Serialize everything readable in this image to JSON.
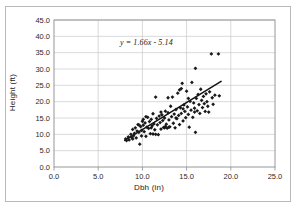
{
  "chart_data": {
    "type": "scatter",
    "title": "",
    "xlabel": "Dbh (in)",
    "ylabel": "Height (ft)",
    "xlim": [
      0.0,
      25.0
    ],
    "ylim": [
      0.0,
      45.0
    ],
    "xticks": [
      "0.0",
      "5.0",
      "10.0",
      "15.0",
      "20.0",
      "25.0"
    ],
    "yticks": [
      "0.0",
      "5.0",
      "10.0",
      "15.0",
      "20.0",
      "25.0",
      "30.0",
      "35.0",
      "40.0",
      "45.0"
    ],
    "xtick_values": [
      0,
      5,
      10,
      15,
      20,
      25
    ],
    "ytick_values": [
      0,
      5,
      10,
      15,
      20,
      25,
      30,
      35,
      40,
      45
    ],
    "grid": "both",
    "legend": "none",
    "marker": "diamond",
    "marker_color": "#1a1a1a",
    "gridline_color": "#c8c8c8",
    "axis_color": "#8c8c8c",
    "plot_background": "#ffffff",
    "annotations": [
      {
        "text": "y = 1.66x - 5.14",
        "x": 10.8,
        "y": 37.2,
        "style": "italic"
      }
    ],
    "trendline": {
      "type": "linear",
      "slope": 1.66,
      "intercept": -5.14,
      "equation": "y = 1.66x - 5.14",
      "x_start": 8.0,
      "x_end": 18.9,
      "color": "#111111"
    },
    "points": [
      [
        8.1,
        8.6
      ],
      [
        8.2,
        8.1
      ],
      [
        8.4,
        9.2
      ],
      [
        8.5,
        8.3
      ],
      [
        8.7,
        10.0
      ],
      [
        8.8,
        9.0
      ],
      [
        8.9,
        11.5
      ],
      [
        9.0,
        9.6
      ],
      [
        9.1,
        10.3
      ],
      [
        9.2,
        12.0
      ],
      [
        9.3,
        8.9
      ],
      [
        9.4,
        11.0
      ],
      [
        9.5,
        13.0
      ],
      [
        9.6,
        10.6
      ],
      [
        9.7,
        7.0
      ],
      [
        9.8,
        12.4
      ],
      [
        9.9,
        11.2
      ],
      [
        10.0,
        14.0
      ],
      [
        10.1,
        12.8
      ],
      [
        10.2,
        10.8
      ],
      [
        10.3,
        13.5
      ],
      [
        10.4,
        9.4
      ],
      [
        10.5,
        12.2
      ],
      [
        10.6,
        15.2
      ],
      [
        10.7,
        11.8
      ],
      [
        10.8,
        13.9
      ],
      [
        10.9,
        10.2
      ],
      [
        11.0,
        14.6
      ],
      [
        11.1,
        12.6
      ],
      [
        11.2,
        16.3
      ],
      [
        11.3,
        13.2
      ],
      [
        11.4,
        11.4
      ],
      [
        11.5,
        21.4
      ],
      [
        11.6,
        14.9
      ],
      [
        11.7,
        12.9
      ],
      [
        11.8,
        9.9
      ],
      [
        11.9,
        15.6
      ],
      [
        12.0,
        13.6
      ],
      [
        12.1,
        11.6
      ],
      [
        12.2,
        16.0
      ],
      [
        12.3,
        14.2
      ],
      [
        12.4,
        12.1
      ],
      [
        12.5,
        15.0
      ],
      [
        12.6,
        17.1
      ],
      [
        12.7,
        13.1
      ],
      [
        12.8,
        11.9
      ],
      [
        12.9,
        16.6
      ],
      [
        13.0,
        14.4
      ],
      [
        13.1,
        12.3
      ],
      [
        13.2,
        18.6
      ],
      [
        13.3,
        15.4
      ],
      [
        13.4,
        21.4
      ],
      [
        13.5,
        13.4
      ],
      [
        13.6,
        16.2
      ],
      [
        13.7,
        12.0
      ],
      [
        13.8,
        17.6
      ],
      [
        13.9,
        14.8
      ],
      [
        14.0,
        22.6
      ],
      [
        14.1,
        15.8
      ],
      [
        14.2,
        13.0
      ],
      [
        14.3,
        18.1
      ],
      [
        14.4,
        16.4
      ],
      [
        14.5,
        25.6
      ],
      [
        14.6,
        14.1
      ],
      [
        14.7,
        19.0
      ],
      [
        14.8,
        17.0
      ],
      [
        14.9,
        15.1
      ],
      [
        15.0,
        23.2
      ],
      [
        15.1,
        18.4
      ],
      [
        15.2,
        16.1
      ],
      [
        15.3,
        12.2
      ],
      [
        15.4,
        20.1
      ],
      [
        15.5,
        17.4
      ],
      [
        15.6,
        25.9
      ],
      [
        15.7,
        15.2
      ],
      [
        15.8,
        19.6
      ],
      [
        15.9,
        18.0
      ],
      [
        16.0,
        10.6
      ],
      [
        16.1,
        21.0
      ],
      [
        16.2,
        17.2
      ],
      [
        16.3,
        22.2
      ],
      [
        16.4,
        19.1
      ],
      [
        16.5,
        16.4
      ],
      [
        16.6,
        23.8
      ],
      [
        16.7,
        20.4
      ],
      [
        16.8,
        18.2
      ],
      [
        16.9,
        21.6
      ],
      [
        17.0,
        19.4
      ],
      [
        17.1,
        17.0
      ],
      [
        17.2,
        22.4
      ],
      [
        17.3,
        20.0
      ],
      [
        17.4,
        18.6
      ],
      [
        17.5,
        16.8
      ],
      [
        17.6,
        23.0
      ],
      [
        17.8,
        34.6
      ],
      [
        17.9,
        21.2
      ],
      [
        18.0,
        19.2
      ],
      [
        18.2,
        22.0
      ],
      [
        18.6,
        34.6
      ],
      [
        18.7,
        21.8
      ],
      [
        16.0,
        30.2
      ],
      [
        12.5,
        12.0
      ],
      [
        13.0,
        12.2
      ],
      [
        11.2,
        10.1
      ],
      [
        11.5,
        10.0
      ],
      [
        10.4,
        15.4
      ],
      [
        12.9,
        21.2
      ],
      [
        14.2,
        23.6
      ],
      [
        14.4,
        24.0
      ],
      [
        15.2,
        21.0
      ],
      [
        9.6,
        12.9
      ],
      [
        10.1,
        14.6
      ],
      [
        13.8,
        15.0
      ],
      [
        14.6,
        17.8
      ],
      [
        15.9,
        16.8
      ],
      [
        12.1,
        16.8
      ],
      [
        12.6,
        12.4
      ],
      [
        11.0,
        12.0
      ],
      [
        9.9,
        9.5
      ],
      [
        8.9,
        8.6
      ]
    ]
  }
}
